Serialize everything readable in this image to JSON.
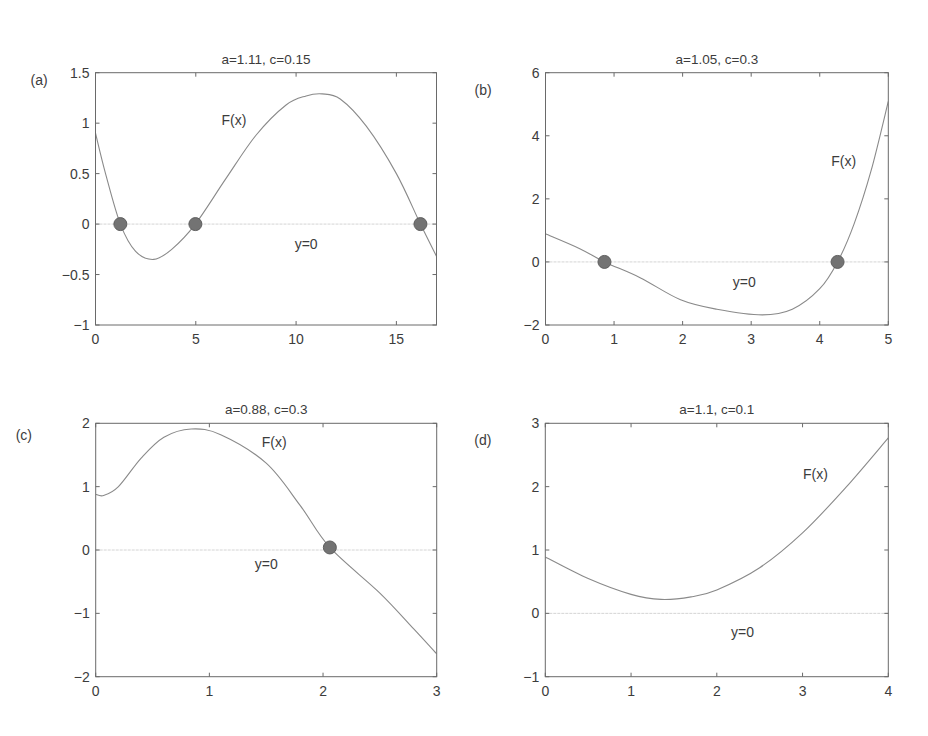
{
  "figure": {
    "background": "#ffffff",
    "curve_color": "#8a8a8a",
    "marker_color": "#737373",
    "zero_line_color": "#d4d4d4",
    "frame_color": "#6a6a6a"
  },
  "chart_data": [
    {
      "type": "line",
      "panel_label": "(a)",
      "title": "a=1.11, c=0.15",
      "xlabel": "",
      "ylabel": "",
      "xlim": [
        0,
        17
      ],
      "ylim": [
        -1,
        1.5
      ],
      "xticks": [
        0,
        5,
        10,
        15
      ],
      "xtick_labels": [
        "0",
        "5",
        "10",
        "15"
      ],
      "yticks": [
        -1,
        -0.5,
        0,
        0.5,
        1,
        1.5
      ],
      "ytick_labels": [
        "−1",
        "−0.5",
        "0",
        "0.5",
        "1",
        "1.5"
      ],
      "grid": false,
      "series": [
        {
          "name": "F(x)",
          "x": [
            0,
            0.5,
            1.24,
            2,
            2.9,
            3.8,
            4.98,
            6.5,
            8,
            9.5,
            10.5,
            11.3,
            12.2,
            13.5,
            15,
            16.2,
            17
          ],
          "y": [
            0.9,
            0.5,
            0.0,
            -0.27,
            -0.35,
            -0.25,
            0.0,
            0.45,
            0.88,
            1.18,
            1.27,
            1.29,
            1.24,
            0.97,
            0.5,
            0.0,
            -0.32
          ]
        },
        {
          "name": "y=0",
          "x": [
            0,
            17
          ],
          "y": [
            0,
            0
          ]
        }
      ],
      "roots": [
        {
          "x": 1.24,
          "y": 0
        },
        {
          "x": 4.98,
          "y": 0
        },
        {
          "x": 16.2,
          "y": 0
        }
      ],
      "annotations": [
        {
          "text": "F(x)",
          "x": 6.9,
          "y": 1.03
        },
        {
          "text": "y=0",
          "x": 10.5,
          "y": -0.2
        }
      ]
    },
    {
      "type": "line",
      "panel_label": "(b)",
      "title": "a=1.05, c=0.3",
      "xlabel": "",
      "ylabel": "",
      "xlim": [
        0,
        5
      ],
      "ylim": [
        -2,
        6
      ],
      "xticks": [
        0,
        1,
        2,
        3,
        4,
        5
      ],
      "xtick_labels": [
        "0",
        "1",
        "2",
        "3",
        "4",
        "5"
      ],
      "yticks": [
        -2,
        0,
        2,
        4,
        6
      ],
      "ytick_labels": [
        "−2",
        "0",
        "2",
        "4",
        "6"
      ],
      "grid": false,
      "series": [
        {
          "name": "F(x)",
          "x": [
            0,
            0.5,
            0.86,
            1.38,
            1.97,
            2.5,
            3.16,
            3.6,
            4.0,
            4.26,
            4.5,
            4.75,
            5.0
          ],
          "y": [
            0.89,
            0.42,
            0.0,
            -0.5,
            -1.2,
            -1.5,
            -1.68,
            -1.5,
            -0.85,
            0.0,
            1.2,
            2.9,
            5.09
          ]
        },
        {
          "name": "y=0",
          "x": [
            0,
            5
          ],
          "y": [
            0,
            0
          ]
        }
      ],
      "roots": [
        {
          "x": 0.86,
          "y": 0
        },
        {
          "x": 4.26,
          "y": 0
        }
      ],
      "annotations": [
        {
          "text": "F(x)",
          "x": 4.35,
          "y": 3.2
        },
        {
          "text": "y=0",
          "x": 2.9,
          "y": -0.65
        }
      ]
    },
    {
      "type": "line",
      "panel_label": "(c)",
      "title": "a=0.88, c=0.3",
      "xlabel": "",
      "ylabel": "",
      "xlim": [
        0,
        3
      ],
      "ylim": [
        -2,
        2
      ],
      "xticks": [
        0,
        1,
        2,
        3
      ],
      "xtick_labels": [
        "0",
        "1",
        "2",
        "3"
      ],
      "yticks": [
        -2,
        -1,
        0,
        1,
        2
      ],
      "ytick_labels": [
        "−2",
        "−1",
        "0",
        "1",
        "2"
      ],
      "grid": false,
      "series": [
        {
          "name": "F(x)",
          "x": [
            0,
            0.07,
            0.2,
            0.4,
            0.6,
            0.84,
            1.1,
            1.5,
            1.8,
            2.06,
            2.5,
            2.8,
            3.0
          ],
          "y": [
            0.88,
            0.86,
            1.0,
            1.45,
            1.78,
            1.91,
            1.82,
            1.37,
            0.7,
            0.04,
            -0.68,
            -1.25,
            -1.64
          ]
        },
        {
          "name": "y=0",
          "x": [
            0,
            3
          ],
          "y": [
            0,
            0
          ]
        }
      ],
      "roots": [
        {
          "x": 2.06,
          "y": 0.04
        }
      ],
      "annotations": [
        {
          "text": "F(x)",
          "x": 1.57,
          "y": 1.7
        },
        {
          "text": "y=0",
          "x": 1.5,
          "y": -0.22
        }
      ]
    },
    {
      "type": "line",
      "panel_label": "(d)",
      "title": "a=1.1, c=0.1",
      "xlabel": "",
      "ylabel": "",
      "xlim": [
        0,
        4
      ],
      "ylim": [
        -1,
        3
      ],
      "xticks": [
        0,
        1,
        2,
        3,
        4
      ],
      "xtick_labels": [
        "0",
        "1",
        "2",
        "3",
        "4"
      ],
      "yticks": [
        -1,
        0,
        1,
        2,
        3
      ],
      "ytick_labels": [
        "−1",
        "0",
        "1",
        "2",
        "3"
      ],
      "grid": false,
      "series": [
        {
          "name": "F(x)",
          "x": [
            0,
            0.5,
            1.0,
            1.35,
            1.7,
            2.0,
            2.5,
            3.0,
            3.5,
            4.0
          ],
          "y": [
            0.89,
            0.55,
            0.3,
            0.22,
            0.26,
            0.37,
            0.72,
            1.27,
            1.98,
            2.77
          ]
        },
        {
          "name": "y=0",
          "x": [
            0,
            4
          ],
          "y": [
            0,
            0
          ]
        }
      ],
      "roots": [],
      "annotations": [
        {
          "text": "F(x)",
          "x": 3.15,
          "y": 2.2
        },
        {
          "text": "y=0",
          "x": 2.3,
          "y": -0.3
        }
      ]
    }
  ],
  "layout": {
    "panels": [
      {
        "left": 95.5,
        "top": 72.7,
        "right": 436.5,
        "bottom": 325
      },
      {
        "left": 545.5,
        "top": 72.7,
        "right": 888.3,
        "bottom": 325
      },
      {
        "left": 95.7,
        "top": 423.3,
        "right": 436.7,
        "bottom": 676.7
      },
      {
        "left": 545.3,
        "top": 423.3,
        "right": 888.3,
        "bottom": 676.7
      }
    ]
  }
}
